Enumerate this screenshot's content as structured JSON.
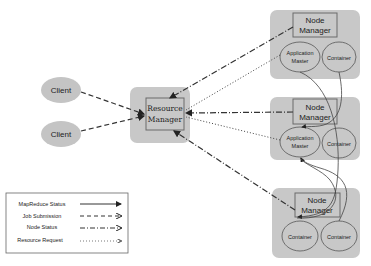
{
  "diagram": {
    "clients": [
      {
        "label": "Client"
      },
      {
        "label": "Client"
      }
    ],
    "resource_manager": {
      "line1": "Resource",
      "line2": "Manager"
    },
    "node_managers": [
      {
        "line1": "Node",
        "line2": "Manager",
        "app_master": {
          "line1": "Application",
          "line2": "Master"
        },
        "containers": [
          "Container"
        ]
      },
      {
        "line1": "Node",
        "line2": "Manager",
        "app_master": {
          "line1": "Application",
          "line2": "Master"
        },
        "containers": [
          "Container"
        ]
      },
      {
        "line1": "Node",
        "line2": "Manager",
        "containers": [
          "Container",
          "Container"
        ]
      }
    ],
    "legend": [
      {
        "label": "MapReduce Status",
        "style": "solid"
      },
      {
        "label": "Job Submission",
        "style": "dashed"
      },
      {
        "label": "Node Status",
        "style": "dash-dot"
      },
      {
        "label": "Resource Request",
        "style": "dotted"
      }
    ],
    "colors": {
      "node_fill": "#c8c8c8",
      "client_fill": "#c4c4c4",
      "box_stroke": "#6a6a6a",
      "line": "#333333"
    }
  }
}
